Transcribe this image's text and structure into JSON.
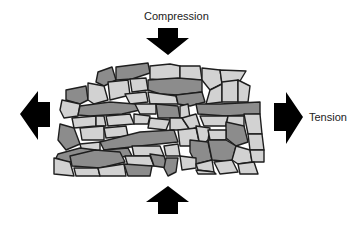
{
  "diagram": {
    "labels": {
      "compression": "Compression",
      "tension": "Tension"
    },
    "colors": {
      "background": "#ffffff",
      "arrow": "#000000",
      "stone_light": "#d2d2d2",
      "stone_dark": "#8c8c8c",
      "stone_outline": "#1e1e1e"
    },
    "arrows": [
      {
        "name": "compression-arrow-top",
        "direction": "down"
      },
      {
        "name": "compression-arrow-bottom",
        "direction": "up"
      },
      {
        "name": "tension-arrow-left",
        "direction": "left"
      },
      {
        "name": "tension-arrow-right",
        "direction": "right"
      }
    ],
    "stone_mass": {
      "description": "Irregular mass of rock fragments / grains (light and dark) deformed under compression and tension"
    }
  }
}
